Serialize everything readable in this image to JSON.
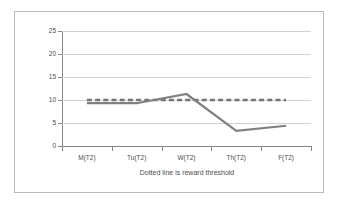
{
  "chart_data": {
    "type": "line",
    "title": "",
    "xlabel": "Dotted line is reward threshold",
    "ylabel": "Misbehaviors",
    "categories": [
      "M(T2)",
      "Tu(T2)",
      "W(T2)",
      "Th(T2)",
      "F(T2)"
    ],
    "series": [
      {
        "name": "Misbehaviors",
        "values": [
          9.3,
          9.3,
          11.3,
          3.3,
          4.4
        ],
        "color": "#808080",
        "style": "solid"
      },
      {
        "name": "Reward threshold",
        "values": [
          10,
          10,
          10,
          10,
          10
        ],
        "color": "#737373",
        "style": "dashed"
      }
    ],
    "ylim": [
      0,
      25
    ],
    "yticks": [
      0,
      5,
      10,
      15,
      20,
      25
    ],
    "ytick_labels": [
      "0",
      "5",
      "10",
      "15",
      "20",
      "25"
    ],
    "grid": true,
    "grid_axis": "y",
    "legend": "none",
    "threshold_value": 10,
    "annotations": [
      "Dotted line is reward threshold"
    ]
  },
  "axes": {
    "y_title": "Misbehaviors",
    "x_title": "Dotted line is reward threshold",
    "y_ticks": [
      "0",
      "5",
      "10",
      "15",
      "20",
      "25"
    ],
    "x_ticks": [
      "M(T2)",
      "Tu(T2)",
      "W(T2)",
      "Th(T2)",
      "F(T2)"
    ]
  },
  "colors": {
    "series_line": "#808080",
    "threshold_line": "#737373",
    "gridline": "#d2d2d2",
    "axis": "#868686",
    "frame": "#b9b9b9",
    "text": "#4d4d4d",
    "background": "#ffffff"
  }
}
